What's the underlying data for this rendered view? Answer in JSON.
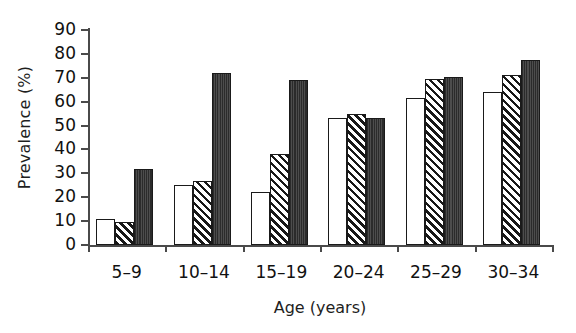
{
  "chart_data": {
    "type": "bar",
    "title": "",
    "xlabel": "Age (years)",
    "ylabel": "Prevalence (%)",
    "categories": [
      "5–9",
      "10–14",
      "15–19",
      "20–24",
      "25–29",
      "30–34"
    ],
    "ylim": [
      0,
      90
    ],
    "ytick_labels": [
      "90",
      "80",
      "70",
      "60",
      "50",
      "40",
      "30",
      "20",
      "10",
      "0"
    ],
    "ytick_values": [
      90,
      80,
      70,
      60,
      50,
      40,
      30,
      20,
      10,
      0
    ],
    "ytick_step": 10,
    "grid": false,
    "legend": "none",
    "series": [
      {
        "name": "series-1-open",
        "fill": "white",
        "values": [
          11,
          25,
          22,
          53,
          61.5,
          64
        ]
      },
      {
        "name": "series-2-hatched",
        "fill": "diagonal-hatch",
        "values": [
          9.5,
          27,
          38,
          55,
          69.5,
          71
        ]
      },
      {
        "name": "series-3-dark",
        "fill": "dark-solid",
        "values": [
          32,
          72,
          69,
          53,
          70.5,
          77.5
        ]
      }
    ]
  },
  "colors": {
    "axis": "#4a4a4a",
    "bar_outline": "#1a1a1a",
    "series_1": "#ffffff",
    "series_2": "#ffffff",
    "series_3": "#3a3a3a",
    "text": "#111111",
    "background": "#ffffff"
  }
}
